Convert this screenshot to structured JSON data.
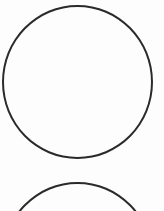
{
  "canvas": {
    "width": 164,
    "height": 211,
    "background": "#fdfdfd"
  },
  "shapes": [
    {
      "type": "circle",
      "left": 2,
      "top": 5,
      "width": 151,
      "height": 154,
      "stroke": "#2a2a2a",
      "stroke_width": 2
    },
    {
      "type": "circle",
      "left": 2,
      "top": 182,
      "width": 151,
      "height": 154,
      "stroke": "#2a2a2a",
      "stroke_width": 2
    }
  ]
}
